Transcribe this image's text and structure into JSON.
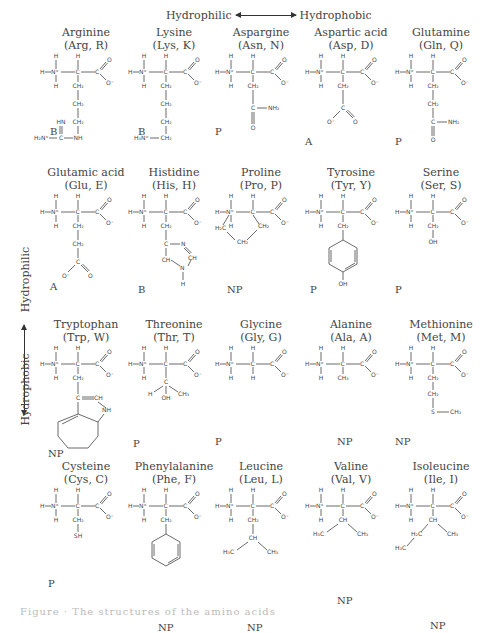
{
  "axes": {
    "horizontal": {
      "left": "Hydrophilic",
      "right": "Hydrophobic"
    },
    "vertical": {
      "top": "Hydrophilic",
      "bottom": "Hydrophobic"
    }
  },
  "legend_codes": {
    "B": "Basic",
    "A": "Acidic",
    "P": "Polar",
    "NP": "Non-polar"
  },
  "amino_acids": [
    {
      "name": "Arginine",
      "abbr": "(Arg, R)",
      "cls": "B",
      "side_chain": [
        "CH2",
        "CH2",
        "CH2",
        "NH",
        "C(=NH)",
        "H2N+"
      ]
    },
    {
      "name": "Lysine",
      "abbr": "(Lys, K)",
      "cls": "B",
      "side_chain": [
        "CH2",
        "CH2",
        "CH2",
        "CH2",
        "H3N+"
      ]
    },
    {
      "name": "Aspargine",
      "abbr": "(Asn, N)",
      "cls": "P",
      "side_chain": [
        "CH2",
        "C(=O)",
        "NH2"
      ]
    },
    {
      "name": "Aspartic acid",
      "abbr": "(Asp, D)",
      "cls": "A",
      "side_chain": [
        "CH2",
        "C(=O)O-"
      ]
    },
    {
      "name": "Glutamine",
      "abbr": "(Gln, Q)",
      "cls": "P",
      "side_chain": [
        "CH2",
        "CH2",
        "C(=O)",
        "NH2"
      ]
    },
    {
      "name": "Glutamic acid",
      "abbr": "(Glu, E)",
      "cls": "A",
      "side_chain": [
        "CH2",
        "CH2",
        "C(=O)O-"
      ]
    },
    {
      "name": "Histidine",
      "abbr": "(His, H)",
      "cls": "B",
      "side_chain": [
        "CH2",
        "imidazole: C, N, CH, N-H, CH"
      ]
    },
    {
      "name": "Proline",
      "abbr": "(Pro, P)",
      "cls": "NP",
      "side_chain": [
        "H2C",
        "CH2",
        "CH2 ring"
      ]
    },
    {
      "name": "Tyrosine",
      "abbr": "(Tyr, Y)",
      "cls": "P",
      "side_chain": [
        "CH2",
        "phenyl",
        "OH"
      ]
    },
    {
      "name": "Serine",
      "abbr": "(Ser, S)",
      "cls": "P",
      "side_chain": [
        "CH2",
        "OH"
      ]
    },
    {
      "name": "Tryptophan",
      "abbr": "(Trp, W)",
      "cls": "NP",
      "side_chain": [
        "CH2",
        "C=CH",
        "NH",
        "indole"
      ]
    },
    {
      "name": "Threonine",
      "abbr": "(Thr, T)",
      "cls": "P",
      "side_chain": [
        "C",
        "H",
        "OH",
        "CH3"
      ]
    },
    {
      "name": "Glycine",
      "abbr": "(Gly, G)",
      "cls": "P",
      "side_chain": [
        "H"
      ]
    },
    {
      "name": "Alanine",
      "abbr": "(Ala, A)",
      "cls": "NP",
      "side_chain": [
        "CH3"
      ]
    },
    {
      "name": "Methionine",
      "abbr": "(Met, M)",
      "cls": "NP",
      "side_chain": [
        "CH2",
        "CH2",
        "S",
        "CH3"
      ]
    },
    {
      "name": "Cysteine",
      "abbr": "(Cys, C)",
      "cls": "P",
      "side_chain": [
        "CH2",
        "SH"
      ]
    },
    {
      "name": "Phenylalanine",
      "abbr": "(Phe, F)",
      "cls": "NP",
      "side_chain": [
        "CH2",
        "phenyl"
      ]
    },
    {
      "name": "Leucine",
      "abbr": "(Leu, L)",
      "cls": "NP",
      "side_chain": [
        "CH2",
        "CH",
        "H3C",
        "CH3"
      ]
    },
    {
      "name": "Valine",
      "abbr": "(Val, V)",
      "cls": "NP",
      "side_chain": [
        "CH",
        "H3C",
        "CH3"
      ]
    },
    {
      "name": "Isoleucine",
      "abbr": "(Ile, I)",
      "cls": "NP",
      "side_chain": [
        "CH",
        "H2C",
        "CH3",
        "H3C"
      ]
    }
  ],
  "backbone_labels": {
    "h": "H",
    "n": "N⁺",
    "c": "C",
    "o": "O",
    "om": "O⁻"
  },
  "caption": "Figure  ·  The  structures  of  the  amino  acids"
}
